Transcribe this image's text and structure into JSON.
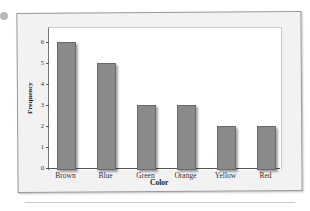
{
  "chart_data": {
    "type": "bar",
    "title": "",
    "xlabel": "Color",
    "ylabel": "Frequency",
    "categories": [
      "Brown",
      "Blue",
      "Green",
      "Orange",
      "Yellow",
      "Red"
    ],
    "values": [
      6,
      5,
      3,
      3,
      2,
      2
    ],
    "ylim": [
      0,
      6
    ],
    "yticks": [
      "0",
      "1",
      "2",
      "3",
      "4",
      "5",
      "6"
    ],
    "grid": false,
    "bar_color": "#8a8a8a"
  }
}
